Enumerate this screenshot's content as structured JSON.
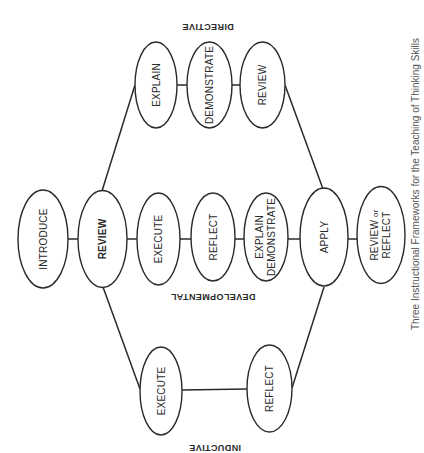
{
  "diagram": {
    "groups": {
      "directive": {
        "label": "DIRECTIVE"
      },
      "developmental": {
        "label": "DEVELOPMENTAL"
      },
      "inductive": {
        "label": "INDUCTIVE"
      }
    },
    "nodes": {
      "introduce": {
        "label": "INTRODUCE"
      },
      "review_main": {
        "label": "REVIEW"
      },
      "dev_execute": {
        "label": "EXECUTE"
      },
      "dev_reflect": {
        "label": "REFLECT"
      },
      "dev_explain_demonstrate": {
        "line1": "EXPLAIN",
        "line2": "DEMONSTRATE"
      },
      "apply": {
        "label": "APPLY"
      },
      "review_or_reflect": {
        "line1_a": "REVIEW ",
        "line1_b": "or",
        "line2": "REFLECT"
      },
      "dir_explain": {
        "label": "EXPLAIN"
      },
      "dir_demonstrate": {
        "label": "DEMONSTRATE"
      },
      "dir_review": {
        "label": "REVIEW"
      },
      "ind_execute": {
        "label": "EXECUTE"
      },
      "ind_reflect": {
        "label": "REFLECT"
      }
    },
    "caption": "Three Instructional Frameworks for the Teaching of Thinking Skills"
  }
}
